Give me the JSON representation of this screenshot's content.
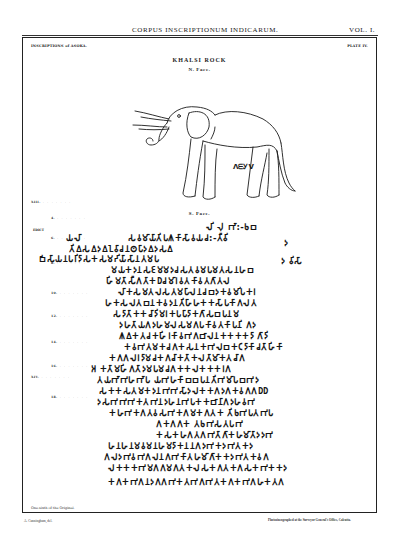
{
  "running_head": {
    "title": "CORPUS INSCRIPTIONUM INDICARUM.",
    "volume": "VOL. I."
  },
  "plate": {
    "series": "INSCRIPTIONS of ASOKA.",
    "number": "PLATE IV.",
    "title": "KHALSI ROCK",
    "north_face_label": "N. Face.",
    "south_face_label": "S. Face.",
    "elephant_caption": "ᐱᗴᎩᐯ",
    "edict_label": "EDICT",
    "line_labels": [
      {
        "label": "XIII.",
        "top": 199
      },
      {
        "label": "4.",
        "top": 215
      },
      {
        "label": "6.",
        "top": 235
      },
      {
        "label": "8.",
        "top": 260
      },
      {
        "label": "10.",
        "top": 290
      },
      {
        "label": "12.",
        "top": 313
      },
      {
        "label": "14.",
        "top": 339
      },
      {
        "label": "16.",
        "top": 363
      },
      {
        "label": "XIV.",
        "top": 374
      },
      {
        "label": "18.",
        "top": 394
      }
    ],
    "script_lines": [
      {
        "text": "𑀮𑀺 𑀮𑀼 𑀪𑀸:-𑀨𑀩",
        "left": 205,
        "top": 222
      },
      {
        "text": "𑀬𑀮𑀸",
        "left": 65,
        "top": 233
      },
      {
        "text": "𑀲𑀯𑀫𑀸𑀬𑀸𑀢𑀺𑀧𑀰𑀓𑀸𑀲𑀸𑀯𑀬𑀘:-𑀢𑀻𑀯𑀺",
        "left": 127,
        "top": 233
      },
      {
        "text": "𑀢𑀺𑀏𑀲𑀏𑀤𑀏𑀑𑀯𑀸𑀘𑀦𑀣𑀧𑀸𑀤𑀏𑀤𑀲𑀏",
        "left": 68,
        "top": 244
      },
      {
        "text": "𑀩𑀺𑀲𑀸𑀬𑀦𑀧𑀭𑀺𑀤𑀸𑀲𑀓𑀲𑀫𑀟𑀺𑀬𑀸𑀲𑀸𑀦𑀢𑀫𑀧",
        "left": 38,
        "top": 254
      },
      {
        "text": "𑀤 𑀯𑀺𑀲𑀸",
        "left": 280,
        "top": 256
      },
      {
        "text": "𑀤",
        "left": 283,
        "top": 238
      },
      {
        "text": "𑀫𑀬𑀓𑀤𑀦𑀲𑀚𑀫𑀫𑀤𑀘𑀲𑀢𑀯𑀫𑀧𑀫𑀢𑀲𑀦𑀳𑀩",
        "left": 110,
        "top": 265
      },
      {
        "text": "𑀳𑀺𑀫𑀢𑀸𑀲𑀻𑀕𑀢𑀸𑀓𑀥𑀘𑀫𑀸𑀭𑀯𑀢𑀓𑀸𑀯𑀢𑀕𑀸𑀢𑀮",
        "left": 105,
        "top": 276
      },
      {
        "text": "𑀮𑀸𑀓𑀲𑀫𑀢𑀮𑀲𑀢𑀫𑀧𑀸𑀮𑀦𑀘𑀩𑀤𑀓𑀯𑀫𑀺𑀧𑀓𑀭",
        "left": 117,
        "top": 287
      },
      {
        "text": "𑀳𑀓𑀲𑀮𑀢𑀩𑀦𑀓𑀯𑀤𑀦𑀢𑀺𑀳𑀸𑀳𑀓𑀓𑀲𑀸𑀧𑀓𑀸𑀕𑀮𑀢",
        "left": 104,
        "top": 298
      },
      {
        "text": "𑀲𑀤𑀸𑀢𑀸𑀓𑀓𑀘𑀸𑀤𑀺𑀫𑀭𑀓𑀧𑀧𑀸𑀤𑀸𑀓𑀕𑀸𑀲𑀩𑀧𑀦𑀫",
        "left": 112,
        "top": 309
      },
      {
        "text": "𑀤𑀳𑀢𑀸𑀬𑀕𑀤𑀳𑀫𑀮𑀲𑀫𑀕𑀧𑀓𑀸𑀯𑀢𑀓𑀸𑀧𑀦𑀺 𑀕𑀤",
        "left": 118,
        "top": 320
      },
      {
        "text": "𑀰𑀏𑀓𑀢𑀘𑀓𑀳𑀺𑀭𑀓𑀸𑀯𑀪𑀕𑀩𑀸𑀮𑀦𑀓𑀓𑀓𑀓𑀤𑀸 𑀕𑀸𑀤𑀺",
        "left": 118,
        "top": 331
      },
      {
        "text": "𑀓𑀯𑀪𑀢𑀫𑀓𑀘𑀕𑀓𑀲𑀦𑀓𑀪𑀮𑀩𑀓𑀝𑀤𑀸𑀓𑀸𑀘𑀢𑀸𑀳𑀺𑀓𑀸",
        "left": 123,
        "top": 342
      },
      {
        "text": "𑀓𑀕𑀕𑀮𑀭𑀤𑀸𑀫𑀘𑀓𑀕𑀘𑀸𑀓𑀢𑀸𑀓𑀮𑀢𑀸𑀫𑀸𑀓𑀢𑀘𑀸𑀕",
        "left": 108,
        "top": 353
      },
      {
        "text": "𑀅 𑀓𑀢𑀸𑀫𑀳𑀺𑀕𑀢𑀸𑀤𑀫𑀧𑀫𑀘𑀕𑀓𑀓𑀮𑀓𑀓𑀓𑀭𑀕",
        "left": 90,
        "top": 364
      },
      {
        "text": "𑀢𑀬𑀪𑀸𑀪𑀳𑀪𑀸𑀧 𑀬𑀪𑀳𑀓𑀸𑀩𑀩𑀧𑀦𑀢𑀺𑀪𑀫𑀸𑀧𑀩𑀪𑀤",
        "left": 96,
        "top": 375
      },
      {
        "text": "𑀲𑀓𑀓𑀲𑀢𑀫𑀓𑀤𑀦𑀪𑀪𑀲𑀸𑀤𑀮𑀓𑀓𑀕𑀤𑀕𑀓𑀯𑀕𑀕𑀥𑀥",
        "left": 98,
        "top": 386
      },
      {
        "text": "𑀤𑀲𑀪𑀪𑀪𑀓𑀢𑀪𑀦𑀤𑀳𑀦𑀪𑀧𑀓𑀓𑀩𑀸𑀦𑀸𑀕𑀤𑀳𑀯𑀪",
        "left": 96,
        "top": 397
      },
      {
        "text": "𑀓𑀳𑀪𑀓𑀕𑀢𑀯𑀲𑀪𑀓𑀕𑀫𑀓𑀕𑀢𑀓 𑀢𑀺𑀨𑀪𑀧𑀢𑀪𑀧",
        "left": 108,
        "top": 408
      },
      {
        "text": "𑀕𑀓𑀕𑀕𑀓 𑀢𑀨𑀪𑀲𑀢𑀧𑀪",
        "left": 155,
        "top": 419
      },
      {
        "text": "𑀓𑀲𑀓𑀳𑀕𑀢𑀕𑀪𑀢𑀸𑀕𑀸𑀓𑀳𑀫𑀸𑀢𑀸𑀤𑀤𑀪",
        "left": 155,
        "top": 430
      },
      {
        "text": "𑀳𑀦𑀳𑀦𑀫𑀯𑀫𑀦𑀳𑀫𑀤𑀸𑀓𑀦𑀦𑀕𑀤𑀪𑀓𑀤𑀪𑀢𑀓𑀤",
        "left": 107,
        "top": 441
      },
      {
        "text": "𑀕𑀮𑀤𑀪𑀯𑀪𑀕𑀮𑀦𑀕𑀪𑀓𑀸𑀢𑀳𑀫𑀸𑀕𑀸𑀓𑀓𑀤𑀪𑀢𑀓𑀯𑀕",
        "left": 103,
        "top": 452
      },
      {
        "text": "𑀮𑀓𑀓𑀓𑀪𑀫𑀕𑀕𑀫𑀕𑀢𑀓𑀮𑀲𑀓𑀕𑀢𑀓𑀕𑀲𑀓𑀪𑀓𑀓𑀤",
        "left": 107,
        "top": 463
      },
      {
        "text": "𑀓𑀕𑀓𑀪𑀕𑀦𑀤𑀕𑀕𑀪𑀓𑀢𑀪𑀕𑀪𑀢𑀓𑀕𑀓𑀪𑀕𑀳𑀓𑀢𑀕",
        "left": 107,
        "top": 477
      }
    ],
    "footnote": "One-sixth of the Original."
  },
  "credits": {
    "left": "A. Cunningham, del.",
    "right": "Photozincographed at the Surveyor General's Office, Calcutta."
  }
}
